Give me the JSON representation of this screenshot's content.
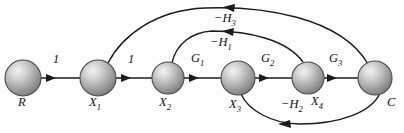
{
  "figure": {
    "type": "signal-flow-graph",
    "background_color": "#fdfdfd",
    "line_color": "#1b1b1b",
    "node_fill_color": "#9a9a9a",
    "node_highlight_color": "#e8e8e8",
    "node_outline_color": "#4a4a4a"
  },
  "nodes": [
    {
      "id": "R",
      "label": "R",
      "label_html": "R",
      "cx": 23,
      "cy": 78,
      "r": 18
    },
    {
      "id": "X1",
      "label": "X1",
      "label_html": "X<sub>1</sub>",
      "cx": 98,
      "cy": 78,
      "r": 18
    },
    {
      "id": "X2",
      "label": "X2",
      "label_html": "X<sub>2</sub>",
      "cx": 168,
      "cy": 78,
      "r": 16
    },
    {
      "id": "X3",
      "label": "X3",
      "label_html": "X<sub>3</sub>",
      "cx": 238,
      "cy": 78,
      "r": 17
    },
    {
      "id": "X4",
      "label": "X4",
      "label_html": "X<sub>4</sub>",
      "cx": 308,
      "cy": 78,
      "r": 16
    },
    {
      "id": "C",
      "label": "C",
      "label_html": "C",
      "cx": 375,
      "cy": 78,
      "r": 17
    }
  ],
  "node_labels": [
    {
      "text": "R",
      "html": "R",
      "x": 18,
      "y": 101
    },
    {
      "text": "X1",
      "html": "X<sub>1</sub>",
      "x": 90,
      "y": 101
    },
    {
      "text": "X2",
      "html": "X<sub>2</sub>",
      "x": 160,
      "y": 101
    },
    {
      "text": "X3",
      "html": "X<sub>3</sub>",
      "x": 230,
      "y": 103
    },
    {
      "text": "X4",
      "html": "X<sub>4</sub>",
      "x": 312,
      "y": 100
    },
    {
      "text": "C",
      "html": "C",
      "x": 388,
      "y": 101
    }
  ],
  "forward_edges": [
    {
      "from": "R",
      "to": "X1",
      "label": "1",
      "label_html": "1",
      "label_x": 55,
      "label_y": 60
    },
    {
      "from": "X1",
      "to": "X2",
      "label": "1",
      "label_html": "1",
      "label_x": 128,
      "label_y": 60
    },
    {
      "from": "X2",
      "to": "X3",
      "label": "G1",
      "label_html": "G<sub>1</sub>",
      "label_x": 194,
      "label_y": 59
    },
    {
      "from": "X3",
      "to": "X4",
      "label": "G2",
      "label_html": "G<sub>2</sub>",
      "label_x": 264,
      "label_y": 59
    },
    {
      "from": "X4",
      "to": "C",
      "label": "G3",
      "label_html": "G<sub>3</sub>",
      "label_x": 332,
      "label_y": 59
    }
  ],
  "feedback_edges": [
    {
      "id": "H3",
      "from": "C",
      "to": "X1",
      "label": "-H3",
      "label_html": "&#8722;H<sub>3</sub>",
      "label_x": 216,
      "label_y": 16,
      "position": "top"
    },
    {
      "id": "H1",
      "from": "X4",
      "to": "X2",
      "label": "-H1",
      "label_html": "&#8722;H<sub>1</sub>",
      "label_x": 212,
      "label_y": 40,
      "position": "middle"
    },
    {
      "id": "H2",
      "from": "C",
      "to": "X3",
      "label": "-H2",
      "label_html": "&#8722;H<sub>2</sub>",
      "label_x": 283,
      "label_y": 102,
      "position": "bottom"
    }
  ]
}
